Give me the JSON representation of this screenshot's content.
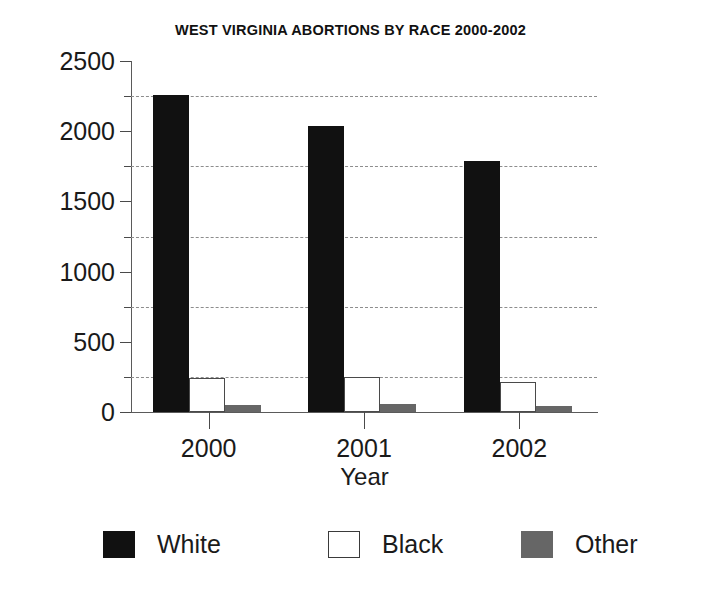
{
  "chart_data": {
    "type": "bar",
    "title": "WEST VIRGINIA ABORTIONS BY RACE 2000-2002",
    "xlabel": "Year",
    "ylabel": "",
    "categories": [
      "2000",
      "2001",
      "2002"
    ],
    "series": [
      {
        "name": "White",
        "color": "#111111",
        "values": [
          2260,
          2040,
          1790
        ]
      },
      {
        "name": "Black",
        "color": "#ffffff",
        "values": [
          245,
          250,
          215
        ]
      },
      {
        "name": "Other",
        "color": "#666666",
        "values": [
          50,
          55,
          40
        ]
      }
    ],
    "ylim": [
      0,
      2500
    ],
    "ytick_labels": [
      "0",
      "500",
      "1000",
      "1500",
      "2000",
      "2500"
    ],
    "ytick_values": [
      0,
      500,
      1000,
      1500,
      2000,
      2500
    ],
    "minor_tick_values": [
      250,
      750,
      1250,
      1750,
      2250
    ],
    "gridline_values": [
      250,
      750,
      1250,
      1750,
      2250
    ],
    "grid": "horizontal-dotted",
    "legend_position": "bottom",
    "legend_entries": [
      "White",
      "Black",
      "Other"
    ]
  }
}
